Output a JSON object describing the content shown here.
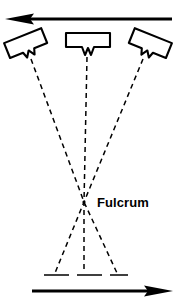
{
  "figure": {
    "background_color": "#ffffff",
    "ink_color": "#000000",
    "width": 178,
    "height": 308
  },
  "labels": {
    "fulcrum": "Fulcrum"
  },
  "arrows": {
    "top": {
      "name": "x-ray-tube-travel-arrow",
      "direction": "left",
      "y": 19,
      "x_start": 172,
      "x_end": 6
    },
    "bottom": {
      "name": "film-travel-arrow",
      "direction": "right",
      "y": 291,
      "x_start": 32,
      "x_end": 172
    }
  },
  "tubes": [
    {
      "name": "x-ray-tube-left",
      "position": "left",
      "tilt_degrees": -22,
      "center_x": 26,
      "center_y": 44
    },
    {
      "name": "x-ray-tube-center",
      "position": "center",
      "tilt_degrees": 0,
      "center_x": 88,
      "center_y": 42
    },
    {
      "name": "x-ray-tube-right",
      "position": "right",
      "tilt_degrees": 22,
      "center_x": 150,
      "center_y": 44
    }
  ],
  "beams": [
    {
      "name": "beam-path-left",
      "from": {
        "x": 31,
        "y": 57
      },
      "via": {
        "x": 84,
        "y": 202
      },
      "to": {
        "x": 117,
        "y": 274
      }
    },
    {
      "name": "beam-path-center",
      "from": {
        "x": 87,
        "y": 55
      },
      "via": {
        "x": 84,
        "y": 202
      },
      "to": {
        "x": 84,
        "y": 274
      }
    },
    {
      "name": "beam-path-right",
      "from": {
        "x": 143,
        "y": 57
      },
      "via": {
        "x": 84,
        "y": 202
      },
      "to": {
        "x": 55,
        "y": 274
      }
    }
  ],
  "fulcrum_point": {
    "x": 84,
    "y": 202
  },
  "film": {
    "name": "film-plane-line",
    "y": 275,
    "x_start": 44,
    "x_end": 128
  }
}
